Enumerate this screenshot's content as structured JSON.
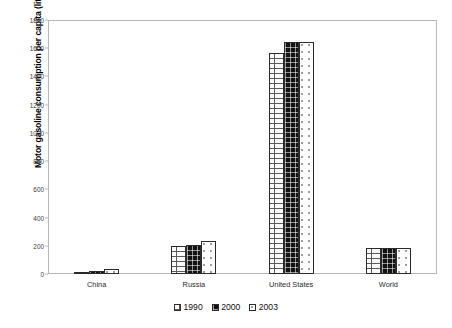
{
  "chart_data": {
    "type": "bar",
    "title": "",
    "xlabel": "",
    "ylabel": "Motor gasoline consumption per capita (liters per person)",
    "categories": [
      "China",
      "Russia",
      "United States",
      "World"
    ],
    "series": [
      {
        "name": "1990",
        "values": [
          12,
          200,
          1565,
          185
        ],
        "pattern": "dashed-hatch",
        "color": "#fdfdfd"
      },
      {
        "name": "2000",
        "values": [
          24,
          205,
          1645,
          185
        ],
        "pattern": "solid-black",
        "color": "#121212"
      },
      {
        "name": "2003",
        "values": [
          34,
          235,
          1645,
          183
        ],
        "pattern": "light-dotted",
        "color": "#ffffff"
      }
    ],
    "ylim": [
      0,
      1800
    ],
    "yticks": [
      0,
      200,
      400,
      600,
      800,
      1000,
      1200,
      1400,
      1600,
      1800
    ],
    "ytick_labels": [
      "0",
      "200",
      "400",
      "600",
      "800",
      "1000",
      "1200",
      "1400",
      "1600",
      "1800"
    ],
    "grid": false,
    "legend_position": "bottom",
    "legend_entries": [
      "1990",
      "2000",
      "2003"
    ]
  },
  "axis": {
    "y_title": "Motor gasoline consumption per capita (liters per person)"
  }
}
